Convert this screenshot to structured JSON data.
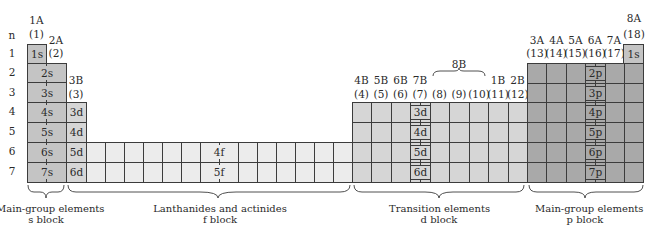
{
  "diagram": {
    "row_header": "n",
    "periods": [
      "1",
      "2",
      "3",
      "4",
      "5",
      "6",
      "7"
    ],
    "group_labels": {
      "g1": {
        "a": "1A",
        "b": "(1)"
      },
      "g2": {
        "a": "2A",
        "b": "(2)"
      },
      "g3": {
        "a": "3B",
        "b": "(3)"
      },
      "g4": {
        "a": "4B",
        "b": "(4)"
      },
      "g5": {
        "a": "5B",
        "b": "(5)"
      },
      "g6": {
        "a": "6B",
        "b": "(6)"
      },
      "g7": {
        "a": "7B",
        "b": "(7)"
      },
      "g8": {
        "b": "(8)"
      },
      "g9": {
        "b": "(9)"
      },
      "g10": {
        "b": "(10)"
      },
      "g8b_group": "8B",
      "g11": {
        "a": "1B",
        "b": "(11)"
      },
      "g12": {
        "a": "2B",
        "b": "(12)"
      },
      "g13": {
        "a": "3A",
        "b": "(13)"
      },
      "g14": {
        "a": "4A",
        "b": "(14)"
      },
      "g15": {
        "a": "5A",
        "b": "(15)"
      },
      "g16": {
        "a": "6A",
        "b": "(16)"
      },
      "g17": {
        "a": "7A",
        "b": "(17)"
      },
      "g18": {
        "a": "8A",
        "b": "(18)"
      }
    },
    "orbitals": {
      "s": [
        "1s",
        "2s",
        "3s",
        "4s",
        "5s",
        "6s",
        "7s"
      ],
      "he": "1s",
      "d_left": [
        "3d",
        "4d",
        "5d",
        "6d"
      ],
      "d_mid": [
        "3d",
        "4d",
        "5d",
        "6d"
      ],
      "f": [
        "4f",
        "5f"
      ],
      "p": [
        "2p",
        "3p",
        "4p",
        "5p",
        "6p",
        "7p"
      ]
    },
    "blocks": [
      {
        "name": "Main-group elements",
        "sub": "s  block"
      },
      {
        "name": "Lanthanides and actinides",
        "sub": "f  block"
      },
      {
        "name": "Transition elements",
        "sub": "d  block"
      },
      {
        "name": "Main-group elements",
        "sub": "p  block"
      }
    ],
    "colors": {
      "s_block": "#c4c4c4",
      "d_block": "#d6d6d6",
      "f_block": "#ececec",
      "p_block": "#a9a9a9",
      "grid_line": "#3c3c3c"
    }
  }
}
